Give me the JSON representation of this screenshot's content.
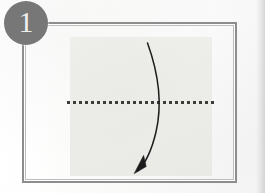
{
  "page": {
    "kind": "origami-instruction-step",
    "background_color": "#fdfdfd",
    "width": 265,
    "height": 193
  },
  "step_badge": {
    "number": "1",
    "shape": "circle",
    "fill_color": "#777777",
    "text_color": "#f0f0ee"
  },
  "frame": {
    "name": "illustration-frame",
    "border_color": "#8d8d8d",
    "inner_rule_color": "#bdbdbd",
    "style": "double-rule-rectangle"
  },
  "diagram": {
    "paper_sheet": {
      "label": "square sheet of paper",
      "fill_color": "#ececE9",
      "shape": "square"
    },
    "fold_line": {
      "label": "horizontal valley fold line",
      "style": "dashed",
      "orientation": "horizontal",
      "color": "#3b3b3b"
    },
    "fold_arrow": {
      "label": "curved fold arrow",
      "direction": "top to bottom",
      "curve": "arc bowing right",
      "color": "#1c1c1c",
      "head": "solid triangle"
    }
  }
}
